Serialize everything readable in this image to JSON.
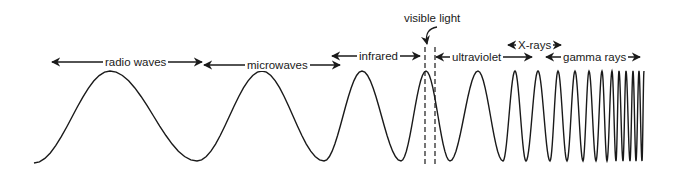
{
  "diagram": {
    "type": "labeled waveform with increasing frequency",
    "colors": {
      "ink": "#1a1a1a",
      "background": "#ffffff"
    },
    "regions": [
      {
        "id": "radio",
        "label": "radio waves",
        "x_start": 52,
        "x_end": 202,
        "arrow_y": 62,
        "label_x": 103
      },
      {
        "id": "micro",
        "label": "microwaves",
        "x_start": 204,
        "x_end": 340,
        "arrow_y": 65,
        "label_x": 245
      },
      {
        "id": "ir",
        "label": "infrared",
        "x_start": 332,
        "x_end": 420,
        "arrow_y": 56,
        "label_x": 357
      },
      {
        "id": "uv",
        "label": "ultraviolet",
        "x_start": 436,
        "x_end": 532,
        "arrow_y": 57,
        "label_x": 450
      },
      {
        "id": "xray",
        "label": "X-rays",
        "x_start": 508,
        "x_end": 561,
        "arrow_y": 45,
        "label_x": 516
      },
      {
        "id": "gamma",
        "label": "gamma rays",
        "x_start": 546,
        "x_end": 640,
        "arrow_y": 57,
        "label_x": 561
      }
    ],
    "visible": {
      "label": "visible light",
      "label_x": 404,
      "label_y": 13,
      "dash_x1": 425,
      "dash_x2": 435,
      "dash_top": 47,
      "dash_bottom": 165
    },
    "wave": {
      "top_y": 71,
      "bottom_y": 161,
      "start": {
        "x": 34,
        "y": 163
      },
      "extrema_x": [
        110,
        197,
        262,
        324,
        362,
        401,
        426,
        450,
        478,
        503,
        515,
        526,
        538,
        550,
        558,
        567,
        575,
        583,
        589,
        596,
        602,
        607,
        612,
        616,
        619,
        623,
        626,
        630,
        633,
        636,
        639,
        642,
        644
      ]
    }
  }
}
